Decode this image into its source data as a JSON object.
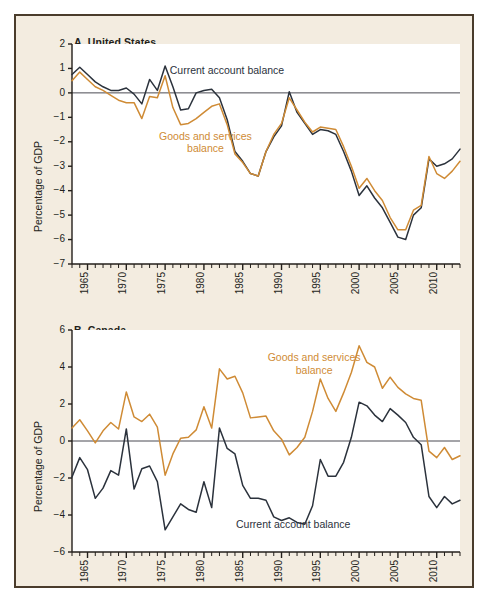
{
  "figure": {
    "background_color": "#f3ece0",
    "border_color": "#4a3c2c",
    "plot_background_color": "#ffffff"
  },
  "colors": {
    "current_account": "#2b323c",
    "goods_services": "#cf8b35",
    "zero_line": "#4a4a52",
    "axis": "#231f1b"
  },
  "panels": [
    {
      "id": "panel-a",
      "title": "A. United States",
      "ylabel": "Percentage of GDP",
      "annotations": [
        {
          "name": "current-account-balance-label",
          "text": "Current account balance",
          "color": "#2b323c"
        },
        {
          "name": "goods-and-services-balance-label",
          "text": "Goods and services",
          "text2": "balance",
          "color": "#cf8b35"
        }
      ]
    },
    {
      "id": "panel-b",
      "title": "B. Canada",
      "ylabel": "Percentage of GDP",
      "annotations": [
        {
          "name": "goods-and-services-balance-label",
          "text": "Goods and services",
          "text2": "balance",
          "color": "#cf8b35"
        },
        {
          "name": "current-account-balance-label",
          "text": "Current account balance",
          "color": "#2b323c"
        }
      ]
    }
  ],
  "chart_data": [
    {
      "type": "line",
      "title": "A. United States",
      "xlabel": "",
      "ylabel": "Percentage of GDP",
      "xlim": [
        1963,
        2013
      ],
      "ylim": [
        -7,
        2
      ],
      "yticks": [
        2,
        1,
        0,
        -1,
        -2,
        -3,
        -4,
        -5,
        -6,
        -7
      ],
      "ytick_labels": [
        "2",
        "1",
        "0",
        "−1",
        "−2",
        "−3",
        "−4",
        "−5",
        "−6",
        "−7"
      ],
      "xticks": [
        1965,
        1970,
        1975,
        1980,
        1985,
        1990,
        1995,
        2000,
        2005,
        2010
      ],
      "xtick_labels": [
        "1965",
        "1970",
        "1975",
        "1980",
        "1985",
        "1990",
        "1995",
        "2000",
        "2005",
        "2010"
      ],
      "minor_xticks_every": 1,
      "grid": false,
      "zero_line": true,
      "legend": "in-plot annotations",
      "x": [
        1963,
        1964,
        1965,
        1966,
        1967,
        1968,
        1969,
        1970,
        1971,
        1972,
        1973,
        1974,
        1975,
        1976,
        1977,
        1978,
        1979,
        1980,
        1981,
        1982,
        1983,
        1984,
        1985,
        1986,
        1987,
        1988,
        1989,
        1990,
        1991,
        1992,
        1993,
        1994,
        1995,
        1996,
        1997,
        1998,
        1999,
        2000,
        2001,
        2002,
        2003,
        2004,
        2005,
        2006,
        2007,
        2008,
        2009,
        2010,
        2011,
        2012,
        2013
      ],
      "series": [
        {
          "name": "Current account balance",
          "color": "#2b323c",
          "values": [
            0.75,
            1.05,
            0.75,
            0.45,
            0.25,
            0.1,
            0.1,
            0.2,
            -0.05,
            -0.45,
            0.55,
            0.1,
            1.1,
            0.25,
            -0.7,
            -0.65,
            0.0,
            0.1,
            0.15,
            -0.2,
            -1.1,
            -2.4,
            -2.8,
            -3.3,
            -3.4,
            -2.4,
            -1.8,
            -1.35,
            0.05,
            -0.8,
            -1.25,
            -1.7,
            -1.5,
            -1.55,
            -1.7,
            -2.4,
            -3.2,
            -4.2,
            -3.8,
            -4.3,
            -4.7,
            -5.3,
            -5.9,
            -6.0,
            -5.0,
            -4.7,
            -2.7,
            -3.0,
            -2.9,
            -2.7,
            -2.3
          ]
        },
        {
          "name": "Goods and services balance",
          "color": "#cf8b35",
          "values": [
            0.5,
            0.85,
            0.55,
            0.25,
            0.1,
            -0.1,
            -0.3,
            -0.4,
            -0.4,
            -1.05,
            -0.15,
            -0.2,
            0.7,
            -0.6,
            -1.3,
            -1.25,
            -1.05,
            -0.8,
            -0.55,
            -0.45,
            -1.3,
            -2.5,
            -2.85,
            -3.3,
            -3.4,
            -2.4,
            -1.7,
            -1.25,
            -0.2,
            -0.7,
            -1.2,
            -1.6,
            -1.4,
            -1.45,
            -1.5,
            -2.2,
            -3.0,
            -3.9,
            -3.5,
            -4.0,
            -4.4,
            -5.1,
            -5.6,
            -5.6,
            -4.8,
            -4.6,
            -2.6,
            -3.3,
            -3.5,
            -3.2,
            -2.8
          ]
        }
      ]
    },
    {
      "type": "line",
      "title": "B. Canada",
      "xlabel": "",
      "ylabel": "Percentage of GDP",
      "xlim": [
        1963,
        2013
      ],
      "ylim": [
        -6,
        6
      ],
      "yticks": [
        6,
        4,
        2,
        0,
        -2,
        -4,
        -6
      ],
      "ytick_labels": [
        "6",
        "4",
        "2",
        "0",
        "−2",
        "−4",
        "−6"
      ],
      "xticks": [
        1965,
        1970,
        1975,
        1980,
        1985,
        1990,
        1995,
        2000,
        2005,
        2010
      ],
      "xtick_labels": [
        "1965",
        "1970",
        "1975",
        "1980",
        "1985",
        "1990",
        "1995",
        "2000",
        "2005",
        "2010"
      ],
      "minor_xticks_every": 1,
      "grid": false,
      "zero_line": true,
      "legend": "in-plot annotations",
      "x": [
        1963,
        1964,
        1965,
        1966,
        1967,
        1968,
        1969,
        1970,
        1971,
        1972,
        1973,
        1974,
        1975,
        1976,
        1977,
        1978,
        1979,
        1980,
        1981,
        1982,
        1983,
        1984,
        1985,
        1986,
        1987,
        1988,
        1989,
        1990,
        1991,
        1992,
        1993,
        1994,
        1995,
        1996,
        1997,
        1998,
        1999,
        2000,
        2001,
        2002,
        2003,
        2004,
        2005,
        2006,
        2007,
        2008,
        2009,
        2010,
        2011,
        2012,
        2013
      ],
      "series": [
        {
          "name": "Goods and services balance",
          "color": "#cf8b35",
          "values": [
            0.7,
            1.15,
            0.55,
            -0.1,
            0.55,
            1.0,
            0.65,
            2.65,
            1.3,
            1.05,
            1.45,
            0.75,
            -1.85,
            -0.7,
            0.15,
            0.2,
            0.6,
            1.85,
            0.7,
            3.9,
            3.35,
            3.5,
            2.6,
            1.25,
            1.3,
            1.35,
            0.55,
            0.1,
            -0.75,
            -0.35,
            0.2,
            1.6,
            3.35,
            2.3,
            1.6,
            2.6,
            3.7,
            5.15,
            4.25,
            4.0,
            2.85,
            3.45,
            2.9,
            2.55,
            2.3,
            2.2,
            -0.55,
            -0.9,
            -0.35,
            -1.0,
            -0.8
          ]
        },
        {
          "name": "Current account balance",
          "color": "#2b323c",
          "values": [
            -1.95,
            -0.9,
            -1.55,
            -3.1,
            -2.55,
            -1.6,
            -1.85,
            0.65,
            -2.6,
            -1.5,
            -1.35,
            -2.2,
            -4.8,
            -4.1,
            -3.4,
            -3.7,
            -3.85,
            -2.2,
            -3.6,
            0.7,
            -0.4,
            -0.7,
            -2.4,
            -3.1,
            -3.1,
            -3.2,
            -4.1,
            -4.3,
            -4.15,
            -4.4,
            -4.5,
            -3.5,
            -1.0,
            -1.9,
            -1.9,
            -1.15,
            0.2,
            2.1,
            1.9,
            1.4,
            1.05,
            1.75,
            1.4,
            1.0,
            0.2,
            -0.2,
            -3.0,
            -3.6,
            -3.0,
            -3.4,
            -3.2
          ]
        }
      ]
    }
  ]
}
